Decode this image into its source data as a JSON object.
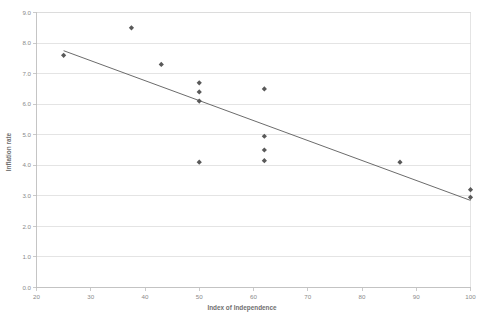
{
  "chart_data": {
    "type": "scatter",
    "title": "",
    "xlabel": "Index of Independence",
    "ylabel": "Inflation rate",
    "xlim": [
      20,
      100
    ],
    "ylim": [
      0.0,
      9.0
    ],
    "xticks": [
      20,
      30,
      40,
      50,
      60,
      70,
      80,
      90,
      100
    ],
    "xticklabels": [
      "20",
      "30",
      "40",
      "50",
      "60",
      "70",
      "80",
      "90",
      "100"
    ],
    "yticks": [
      0.0,
      1.0,
      2.0,
      3.0,
      4.0,
      5.0,
      6.0,
      7.0,
      8.0,
      9.0
    ],
    "yticklabels": [
      "0.0",
      "1.0",
      "2.0",
      "3.0",
      "4.0",
      "5.0",
      "6.0",
      "7.0",
      "8.0",
      "9.0"
    ],
    "grid": "horizontal",
    "legend": "none",
    "marker_shape": "diamond",
    "marker_color": "#595959",
    "trendline_color": "#5a5a5a",
    "points": [
      {
        "x": 25.0,
        "y": 7.6
      },
      {
        "x": 37.5,
        "y": 8.5
      },
      {
        "x": 43.0,
        "y": 7.3
      },
      {
        "x": 50.0,
        "y": 6.7
      },
      {
        "x": 50.0,
        "y": 6.4
      },
      {
        "x": 50.0,
        "y": 6.1
      },
      {
        "x": 50.0,
        "y": 4.1
      },
      {
        "x": 62.0,
        "y": 6.5
      },
      {
        "x": 62.0,
        "y": 4.95
      },
      {
        "x": 62.0,
        "y": 4.5
      },
      {
        "x": 62.0,
        "y": 4.15
      },
      {
        "x": 87.0,
        "y": 4.1
      },
      {
        "x": 100.0,
        "y": 3.2
      },
      {
        "x": 100.0,
        "y": 2.95
      }
    ],
    "trendline": {
      "x_start": 25.0,
      "y_start": 7.75,
      "x_end": 100.0,
      "y_end": 2.85
    }
  },
  "colors": {
    "marker": "#595959",
    "trendline": "#5a5a5a",
    "gridline": "#d9d9d9",
    "axis": "#bdbdbd",
    "tick_label": "#8a8a8a",
    "axis_title": "#6f6f6f",
    "background": "#ffffff"
  }
}
